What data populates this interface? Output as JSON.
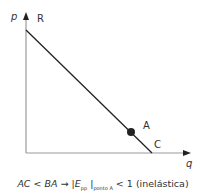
{
  "diagram": {
    "type": "linear demand curve",
    "axes": {
      "y_label": "p",
      "x_label": "q"
    },
    "points": {
      "top": "R",
      "marked": "A",
      "bottom": "C"
    },
    "colors": {
      "axis": "#999999",
      "curve": "#222222",
      "point": "#222222",
      "text": "#333333"
    }
  },
  "caption": {
    "lhs": "AC < BA",
    "arrow": "→",
    "bar_open": "|",
    "elasticity": "E",
    "elasticity_sub": "pp",
    "bar_close": "|",
    "point_sub": "ponto A",
    "rhs": "< 1 (inelástica)"
  }
}
